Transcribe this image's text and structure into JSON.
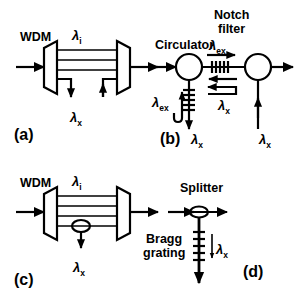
{
  "figure": {
    "background_color": "#ffffff",
    "ink_color": "#000000",
    "width": 297,
    "height": 289
  },
  "panels": [
    {
      "id": "a",
      "label": "(a)",
      "components": [
        {
          "name": "WDM",
          "label": "WDM"
        }
      ],
      "signals": [
        {
          "name": "through-wavelength",
          "symbol": "λ",
          "subscript": "i"
        },
        {
          "name": "drop-add-wavelength",
          "symbol": "λ",
          "subscript": "x"
        }
      ]
    },
    {
      "id": "b",
      "label": "(b)",
      "components": [
        {
          "name": "Circulator",
          "label": "Circulator"
        },
        {
          "name": "Notch filter",
          "label_line1": "Notch",
          "label_line2": "filter"
        }
      ],
      "signals": [
        {
          "name": "express-wavelength-top",
          "symbol": "λ",
          "subscript": "ex"
        },
        {
          "name": "express-wavelength-left",
          "symbol": "λ",
          "subscript": "ex"
        },
        {
          "name": "reflected-wavelength-mid",
          "symbol": "λ",
          "subscript": "x"
        },
        {
          "name": "dropped-wavelength",
          "symbol": "λ",
          "subscript": "x"
        },
        {
          "name": "added-wavelength",
          "symbol": "λ",
          "subscript": "x"
        }
      ]
    },
    {
      "id": "c",
      "label": "(c)",
      "components": [
        {
          "name": "WDM",
          "label": "WDM"
        }
      ],
      "signals": [
        {
          "name": "through-wavelength",
          "symbol": "λ",
          "subscript": "i"
        },
        {
          "name": "drop-wavelength",
          "symbol": "λ",
          "subscript": "x"
        }
      ]
    },
    {
      "id": "d",
      "label": "(d)",
      "components": [
        {
          "name": "Splitter",
          "label": "Splitter"
        },
        {
          "name": "Bragg grating",
          "label_line1": "Bragg",
          "label_line2": "grating"
        }
      ],
      "signals": [
        {
          "name": "dropped-wavelength",
          "symbol": "λ",
          "subscript": "x"
        }
      ]
    }
  ],
  "labels": {
    "wdm_a": "WDM",
    "wdm_c": "WDM",
    "circulator": "Circulator",
    "notch_line1": "Notch",
    "notch_line2": "filter",
    "splitter": "Splitter",
    "bragg_line1": "Bragg",
    "bragg_line2": "grating",
    "panel_a": "(a)",
    "panel_b": "(b)",
    "panel_c": "(c)",
    "panel_d": "(d)",
    "lambda": "λ",
    "sub_i": "i",
    "sub_x": "x",
    "sub_ex": "ex"
  }
}
